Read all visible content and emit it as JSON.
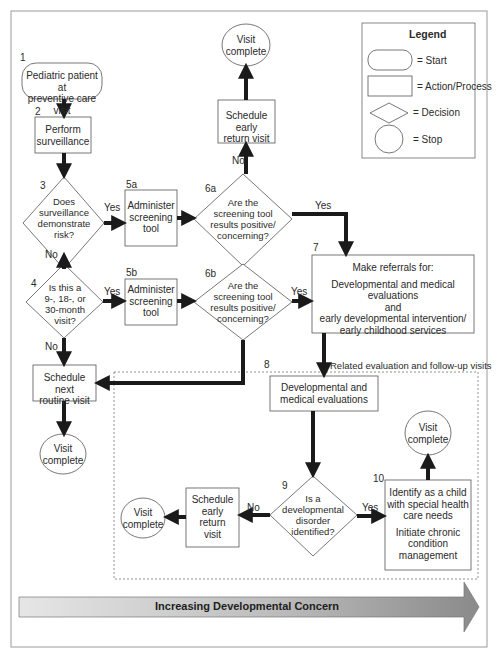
{
  "legend": {
    "title": "Legend",
    "items": [
      {
        "shape": "rounded-rect",
        "label": "= Start"
      },
      {
        "shape": "rect",
        "label": "= Action/Process"
      },
      {
        "shape": "diamond",
        "label": "= Decision"
      },
      {
        "shape": "circle",
        "label": "= Stop"
      }
    ]
  },
  "nodes": {
    "n1": {
      "num": "1",
      "text": "Pediatric patient at preventive care visit",
      "lines": [
        "Pediatric patient at",
        "preventive care visit"
      ],
      "type": "start"
    },
    "n2": {
      "num": "2",
      "lines": [
        "Perform",
        "surveillance"
      ],
      "type": "process"
    },
    "n3": {
      "num": "3",
      "lines": [
        "Does",
        "surveillance",
        "demonstrate",
        "risk?"
      ],
      "type": "decision"
    },
    "n4": {
      "num": "4",
      "lines": [
        "Is this a",
        "9-, 18-, or",
        "30-month",
        "visit?"
      ],
      "type": "decision"
    },
    "n5a": {
      "num": "5a",
      "lines": [
        "Administer",
        "screening",
        "tool"
      ],
      "type": "process"
    },
    "n5b": {
      "num": "5b",
      "lines": [
        "Administer",
        "screening",
        "tool"
      ],
      "type": "process"
    },
    "n6a": {
      "num": "6a",
      "lines": [
        "Are the",
        "screening tool",
        "results positive/",
        "concerning?"
      ],
      "type": "decision"
    },
    "n6b": {
      "num": "6b",
      "lines": [
        "Are the",
        "screening tool",
        "results positive/",
        "concerning?"
      ],
      "type": "decision"
    },
    "early_return_top": {
      "lines": [
        "Schedule early",
        "return visit"
      ],
      "type": "process"
    },
    "visit_complete_top": {
      "lines": [
        "Visit",
        "complete"
      ],
      "type": "stop"
    },
    "n7": {
      "num": "7",
      "heading": "Make referrals for:",
      "lines": [
        "Developmental and medical evaluations",
        "and",
        "early developmental intervention/",
        "early childhood services"
      ],
      "type": "process"
    },
    "next_routine": {
      "lines": [
        "Schedule next",
        "routine visit"
      ],
      "type": "process"
    },
    "visit_complete_left": {
      "lines": [
        "Visit",
        "complete"
      ],
      "type": "stop"
    },
    "n8": {
      "num": "8",
      "label": "Related evaluation and follow-up visits",
      "lines": [
        "Developmental and",
        "medical evaluations"
      ],
      "type": "process"
    },
    "n9": {
      "num": "9",
      "lines": [
        "Is a",
        "developmental",
        "disorder",
        "identified?"
      ],
      "type": "decision"
    },
    "early_return_bottom": {
      "lines": [
        "Schedule",
        "early",
        "return",
        "visit"
      ],
      "type": "process"
    },
    "visit_complete_bottom": {
      "lines": [
        "Visit",
        "complete"
      ],
      "type": "stop"
    },
    "n10": {
      "num": "10",
      "lines": [
        "Identify as a child",
        "with special health",
        "care needs"
      ],
      "lines2": [
        "Initiate chronic",
        "condition",
        "management"
      ],
      "type": "process"
    },
    "visit_complete_right": {
      "lines": [
        "Visit",
        "complete"
      ],
      "type": "stop"
    }
  },
  "edge_labels": {
    "yes": "Yes",
    "no": "No"
  },
  "bottom_arrow": {
    "label": "Increasing Developmental Concern"
  },
  "colors": {
    "line": "#1a1a1a",
    "box_border": "#555555",
    "frame": "#9a9a9a",
    "arrow_light": "#e4e4e4",
    "arrow_dark": "#8c8c8c"
  }
}
